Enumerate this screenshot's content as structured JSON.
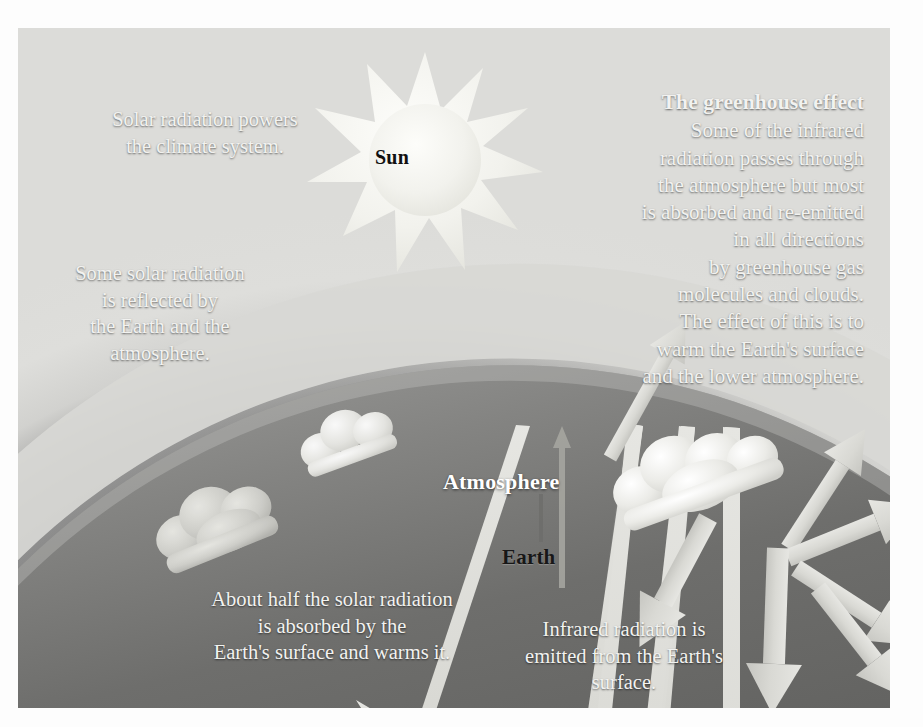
{
  "figure": {
    "title": "The greenhouse effect",
    "type": "climate-system-diagram",
    "palette": {
      "page_background": "#ffffff",
      "sky_dark": "#6f6f6f",
      "sky_mid": "#7c7c7c",
      "atmosphere_glow": "#d2d2d0",
      "earth_body": "#6a6a6a",
      "earth_bright": "#c9c9c7",
      "arrow_fill": "#dcdcd8",
      "arrow_dim": "#8d8d8a",
      "sun_fill": "#f4f4f0",
      "text_light": "#f2f2f0",
      "text_dark": "#171717"
    }
  },
  "labels": {
    "sun": "Sun",
    "atmosphere": "Atmosphere",
    "earth": "Earth"
  },
  "annotations": {
    "greenhouse": {
      "heading": "The greenhouse effect",
      "body": "Some of the infrared\nradiation passes through\nthe atmosphere but most\nis absorbed and re-emitted\nin all directions\nby greenhouse gas\nmolecules and clouds.\nThe effect of this is to\nwarm the Earth's surface\nand the lower atmosphere."
    },
    "solar_power": "Solar radiation powers\nthe climate system.",
    "reflected": "Some solar radiation\nis reflected by\nthe Earth and the\natmosphere.",
    "absorbed_half": "About half the solar radiation\nis absorbed by the\nEarth's surface and warms it.",
    "infrared_emitted": "Infrared radiation is\nemitted from the Earth's\nsurface."
  },
  "elements": {
    "sun_points": 12,
    "incoming_beams": 3,
    "reflected_beams": 2,
    "cloud_clusters": 3,
    "infrared_arrows": 8
  }
}
